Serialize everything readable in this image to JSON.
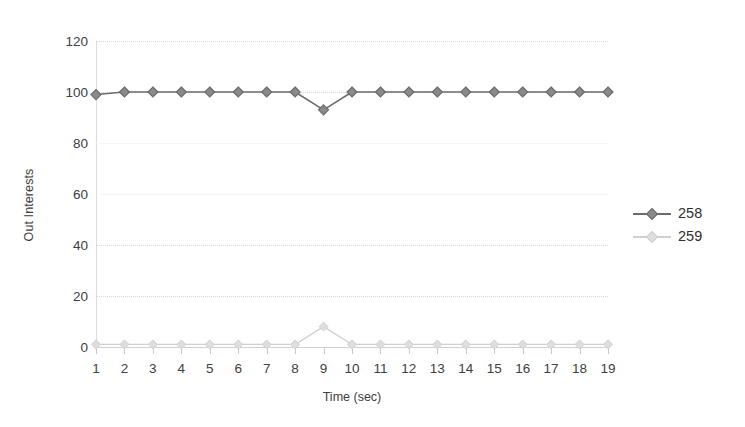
{
  "chart_data": {
    "type": "line",
    "title": "",
    "xlabel": "Time (sec)",
    "ylabel": "Out Interests",
    "x": [
      1,
      2,
      3,
      4,
      5,
      6,
      7,
      8,
      9,
      10,
      11,
      12,
      13,
      14,
      15,
      16,
      17,
      18,
      19
    ],
    "xlim": [
      1,
      19
    ],
    "ylim": [
      0,
      120
    ],
    "yticks": [
      0,
      20,
      40,
      60,
      80,
      100,
      120
    ],
    "xticks": [
      1,
      2,
      3,
      4,
      5,
      6,
      7,
      8,
      9,
      10,
      11,
      12,
      13,
      14,
      15,
      16,
      17,
      18,
      19
    ],
    "grid": true,
    "legend_position": "right",
    "series": [
      {
        "name": "258",
        "color": "#6b6b6b",
        "marker": "diamond",
        "values": [
          99,
          100,
          100,
          100,
          100,
          100,
          100,
          100,
          93,
          100,
          100,
          100,
          100,
          100,
          100,
          100,
          100,
          100,
          100
        ]
      },
      {
        "name": "259",
        "color": "#cfcfcf",
        "marker": "diamond",
        "values": [
          1,
          1,
          1,
          1,
          1,
          1,
          1,
          1,
          8,
          1,
          1,
          1,
          1,
          1,
          1,
          1,
          1,
          1,
          1
        ]
      }
    ]
  },
  "axis": {
    "y_title": "Out Interests",
    "x_title": "Time (sec)",
    "y_tick_labels": [
      "120",
      "100",
      "80",
      "60",
      "40",
      "20",
      "0"
    ],
    "x_tick_labels": [
      "1",
      "2",
      "3",
      "4",
      "5",
      "6",
      "7",
      "8",
      "9",
      "10",
      "11",
      "12",
      "13",
      "14",
      "15",
      "16",
      "17",
      "18",
      "19"
    ]
  },
  "legend": {
    "entries": [
      {
        "label": "258",
        "color": "#6b6b6b"
      },
      {
        "label": "259",
        "color": "#cfcfcf"
      }
    ]
  },
  "colors": {
    "series_258": "#6b6b6b",
    "series_259": "#cfcfcf",
    "gridline": "#d9d9d9",
    "axis": "#c9c9c9",
    "text": "#3d3d3d",
    "background": "#ffffff"
  }
}
